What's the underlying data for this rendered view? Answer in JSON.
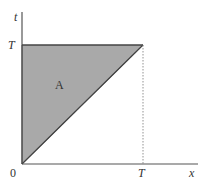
{
  "diagram": {
    "type": "region-diagram",
    "axes": {
      "x_label": "x",
      "y_label": "t",
      "origin_label": "0",
      "x_tick_label": "T",
      "y_tick_label": "T"
    },
    "region": {
      "label": "A",
      "shape": "triangle",
      "vertices_math": [
        [
          0,
          0
        ],
        [
          0,
          "T"
        ],
        [
          "T",
          "T"
        ]
      ],
      "fill_color": "#a9a9a9"
    },
    "colors": {
      "axis": "#555555",
      "edge": "#444444",
      "dotted_guide": "#777777"
    }
  }
}
